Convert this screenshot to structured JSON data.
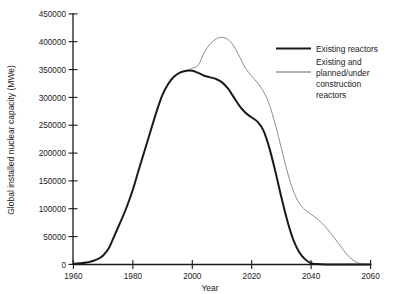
{
  "chart_data": {
    "type": "line",
    "title": "",
    "xlabel": "Year",
    "ylabel": "Global installed nuclear capacity (MWe)",
    "xlim": [
      1960,
      2060
    ],
    "ylim": [
      0,
      450000
    ],
    "grid": false,
    "legend_position": "top-right",
    "xticks": [
      1960,
      1980,
      2000,
      2020,
      2040,
      2060
    ],
    "xtick_labels": [
      "1960",
      "1980",
      "2000",
      "2020",
      "2040",
      "2060"
    ],
    "yticks": [
      0,
      50000,
      100000,
      150000,
      200000,
      250000,
      300000,
      350000,
      400000,
      450000
    ],
    "ytick_labels": [
      "0",
      "50000",
      "100000",
      "150000",
      "200000",
      "250000",
      "300000",
      "350000",
      "400000",
      "450000"
    ],
    "series": [
      {
        "name": "Existing reactors",
        "color": "#1a1a1a",
        "x": [
          1960,
          1965,
          1968,
          1970,
          1972,
          1974,
          1976,
          1978,
          1980,
          1982,
          1984,
          1986,
          1988,
          1990,
          1992,
          1994,
          1996,
          1998,
          2000,
          2002,
          2004,
          2006,
          2008,
          2010,
          2012,
          2014,
          2016,
          2018,
          2020,
          2022,
          2024,
          2026,
          2028,
          2030,
          2032,
          2034,
          2036,
          2038,
          2040,
          2042,
          2045,
          2050,
          2060
        ],
        "y": [
          1000,
          4000,
          9000,
          16000,
          30000,
          54000,
          78000,
          104000,
          134000,
          170000,
          205000,
          240000,
          275000,
          305000,
          325000,
          338000,
          345000,
          348000,
          348000,
          344000,
          339000,
          336000,
          333000,
          327000,
          316000,
          300000,
          284000,
          272000,
          264000,
          256000,
          240000,
          208000,
          166000,
          120000,
          78000,
          44000,
          22000,
          9000,
          2000,
          500,
          0,
          0,
          0
        ]
      },
      {
        "name": "Existing and planned/under construction reactors",
        "color": "#8c8c8c",
        "x": [
          1998,
          2000,
          2002,
          2004,
          2006,
          2008,
          2010,
          2012,
          2014,
          2016,
          2018,
          2020,
          2022,
          2024,
          2026,
          2028,
          2030,
          2032,
          2034,
          2036,
          2038,
          2040,
          2042,
          2044,
          2046,
          2048,
          2050,
          2052,
          2054,
          2056,
          2058,
          2060
        ],
        "y": [
          348000,
          352000,
          358000,
          380000,
          396000,
          405000,
          408000,
          404000,
          392000,
          372000,
          352000,
          338000,
          326000,
          310000,
          286000,
          250000,
          208000,
          166000,
          132000,
          110000,
          98000,
          90000,
          82000,
          72000,
          60000,
          46000,
          32000,
          18000,
          8000,
          2000,
          500,
          0
        ]
      }
    ]
  },
  "legend": {
    "entries": [
      {
        "label": "Existing reactors"
      },
      {
        "label": "Existing and\nplanned/under\nconstruction\nreactors"
      }
    ],
    "entry2_line1": "Existing and",
    "entry2_line2": "planned/under",
    "entry2_line3": "construction",
    "entry2_line4": "reactors"
  },
  "colors": {
    "existing": "#1a1a1a",
    "planned": "#8c8c8c",
    "background": "#ffffff",
    "axis": "#1a1a1a"
  }
}
